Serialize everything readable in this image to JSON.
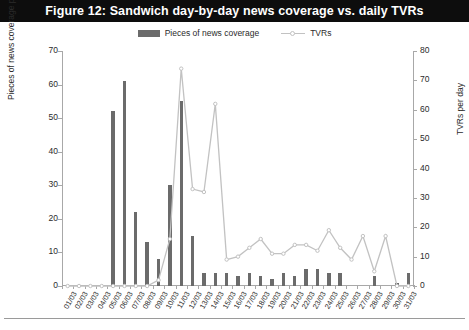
{
  "title": "Figure 12: Sandwich day-by-day news coverage vs. daily TVRs",
  "legend": {
    "items": [
      {
        "label": "Pieces of news coverage",
        "type": "bar",
        "color": "#6b6b6b"
      },
      {
        "label": "TVRs",
        "type": "line",
        "color": "#c2c2c2"
      }
    ]
  },
  "colors": {
    "banner_bg": "#0d0d0d",
    "banner_text": "#ffffff",
    "bar": "#6b6b6b",
    "line": "#c2c2c2",
    "axis": "#a8a8a8",
    "text": "#2b2b2b",
    "background": "#ffffff"
  },
  "chart_data": {
    "type": "bar",
    "title": "Figure 12: Sandwich day-by-day news coverage vs. daily TVRs",
    "xlabel": "",
    "ylabel": "Pieces of news coverage per day",
    "y2label": "TVRs per day",
    "ylim": [
      0,
      70
    ],
    "y2lim": [
      0,
      80
    ],
    "yticks": [
      0,
      10,
      20,
      30,
      40,
      50,
      60,
      70
    ],
    "y2ticks": [
      0,
      10,
      20,
      30,
      40,
      50,
      60,
      70,
      80
    ],
    "grid": false,
    "legend_position": "top",
    "categories": [
      "01/03",
      "02/03",
      "03/03",
      "04/03",
      "05/03",
      "06/03",
      "07/03",
      "08/03",
      "09/03",
      "10/03",
      "11/03",
      "12/03",
      "13/03",
      "14/03",
      "15/03",
      "16/03",
      "17/03",
      "18/03",
      "19/03",
      "20/03",
      "21/03",
      "22/03",
      "23/03",
      "24/03",
      "25/03",
      "26/03",
      "27/03",
      "28/03",
      "29/03",
      "30/03",
      "31/03"
    ],
    "series": [
      {
        "name": "Pieces of news coverage",
        "type": "bar",
        "axis": "left",
        "color": "#6b6b6b",
        "values": [
          0,
          0,
          0,
          0,
          52,
          61,
          22,
          13,
          8,
          30,
          55,
          15,
          4,
          4,
          4,
          3,
          4,
          3,
          2,
          4,
          3,
          5,
          5,
          4,
          4,
          0,
          0,
          3,
          0,
          1,
          4
        ]
      },
      {
        "name": "TVRs",
        "type": "line",
        "axis": "right",
        "color": "#c2c2c2",
        "values": [
          0,
          0,
          0,
          0,
          0,
          0,
          0,
          0,
          2,
          16,
          74,
          33,
          32,
          62,
          9,
          10,
          13,
          16,
          11,
          11,
          14,
          14,
          12,
          19,
          13,
          9,
          17,
          5,
          17,
          0,
          0
        ]
      }
    ]
  }
}
